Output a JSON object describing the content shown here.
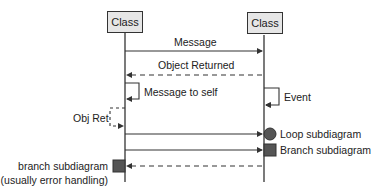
{
  "diagram": {
    "type": "sequence-diagram",
    "participants": [
      {
        "label": "Class"
      },
      {
        "label": "Class"
      }
    ],
    "messages": [
      {
        "label": "Message",
        "from": 0,
        "to": 1,
        "style": "solid"
      },
      {
        "label": "Object Returned",
        "from": 1,
        "to": 0,
        "style": "dashed"
      },
      {
        "label": "Message to self",
        "from": 0,
        "to": 0,
        "style": "solid"
      },
      {
        "label": "Event",
        "from": 1,
        "to": 1,
        "style": "solid"
      },
      {
        "label": "Obj Ret",
        "from": 0,
        "to": 0,
        "style": "dashed"
      },
      {
        "label": "Loop subdiagram",
        "from": 0,
        "to": 1,
        "style": "solid",
        "marker": "circle"
      },
      {
        "label": "Branch subdiagram",
        "from": 0,
        "to": 1,
        "style": "solid",
        "marker": "square"
      },
      {
        "label_line1": "branch subdiagram",
        "label_line2": "(usually error handling)",
        "from": 1,
        "to": 0,
        "style": "dashed",
        "marker": "square"
      }
    ],
    "colors": {
      "line": "#333333",
      "box_fill": "#e6e6e6",
      "marker_fill": "#555555",
      "text": "#222222"
    }
  }
}
